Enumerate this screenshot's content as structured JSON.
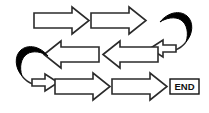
{
  "diagram": {
    "type": "flow-diagram",
    "background_color": "#ffffff",
    "outline_color": "#2b2b2b",
    "fill_color": "#ffffff",
    "solid_color": "#000000",
    "rows": [
      {
        "name": "row-1",
        "direction": "right",
        "arrows": [
          {
            "name": "arrow-1",
            "label": "",
            "direction": "right"
          },
          {
            "name": "arrow-2",
            "label": "",
            "direction": "right"
          }
        ]
      },
      {
        "name": "row-2",
        "direction": "left",
        "arrows": [
          {
            "name": "arrow-3",
            "label": "",
            "direction": "left"
          },
          {
            "name": "arrow-4",
            "label": "",
            "direction": "left"
          }
        ]
      },
      {
        "name": "row-3",
        "direction": "right",
        "arrows": [
          {
            "name": "arrow-5",
            "label": "",
            "direction": "right"
          },
          {
            "name": "arrow-6",
            "label": "",
            "direction": "right"
          }
        ]
      }
    ],
    "connectors": [
      {
        "name": "turn-right",
        "label": "",
        "position": "right",
        "style": "curved-u-turn",
        "fill": "#000000"
      },
      {
        "name": "turn-left",
        "label": "",
        "position": "left",
        "style": "curved-u-turn",
        "fill": "#000000"
      }
    ],
    "end_marker": {
      "label": "END",
      "border_color": "#111111",
      "text_color": "#111111"
    }
  }
}
